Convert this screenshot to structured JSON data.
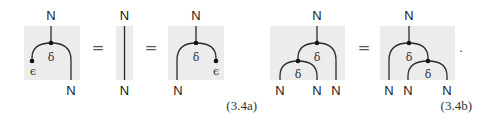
{
  "equations": [
    {
      "id": "3.4a",
      "number": "(3.4a)",
      "description": "Counit law: epsilon applied to either output of delta equals identity",
      "diagrams": [
        {
          "name": "counit-left",
          "top_label": "N",
          "bottom_labels": [
            "N"
          ],
          "node_labels": [
            "δ"
          ],
          "counit_label": "ϵ"
        },
        {
          "name": "identity",
          "top_label": "N",
          "bottom_labels": [
            "N"
          ]
        },
        {
          "name": "counit-right",
          "top_label": "N",
          "bottom_labels": [
            "N"
          ],
          "node_labels": [
            "δ"
          ],
          "counit_label": "ϵ"
        }
      ],
      "operators": [
        "=",
        "="
      ]
    },
    {
      "id": "3.4b",
      "number": "(3.4b)",
      "description": "Coassociativity of delta",
      "diagrams": [
        {
          "name": "coassoc-left",
          "top_label": "N",
          "bottom_labels": [
            "N",
            "N",
            "N"
          ],
          "node_labels": [
            "δ",
            "δ"
          ]
        },
        {
          "name": "coassoc-right",
          "top_label": "N",
          "bottom_labels": [
            "N",
            "N",
            "N"
          ],
          "node_labels": [
            "δ",
            "δ"
          ]
        }
      ],
      "operators": [
        "="
      ],
      "trailing_punctuation": "."
    }
  ],
  "colors": {
    "box_fill": "#ececec",
    "wire": "#2a2a2a",
    "node": "#111111"
  }
}
